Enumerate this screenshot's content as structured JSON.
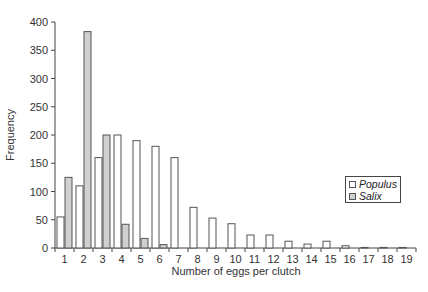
{
  "chart_data": {
    "type": "bar",
    "title": "",
    "xlabel": "Number of eggs per clutch",
    "ylabel": "Frequency",
    "ylim": [
      0,
      400
    ],
    "yticks": [
      0,
      50,
      100,
      150,
      200,
      250,
      300,
      350,
      400
    ],
    "grid": false,
    "legend_position": "right",
    "categories": [
      "1",
      "2",
      "3",
      "4",
      "5",
      "6",
      "7",
      "8",
      "9",
      "10",
      "11",
      "12",
      "13",
      "14",
      "15",
      "16",
      "17",
      "18",
      "19"
    ],
    "series": [
      {
        "name": "Populus",
        "color": "#ffffff",
        "values": [
          55,
          110,
          160,
          200,
          190,
          180,
          160,
          72,
          53,
          43,
          23,
          23,
          12,
          7,
          12,
          4,
          1,
          1,
          1
        ]
      },
      {
        "name": "Salix",
        "color": "#d0d0d0",
        "values": [
          125,
          383,
          200,
          42,
          17,
          6,
          0,
          0,
          0,
          0,
          0,
          0,
          0,
          0,
          0,
          0,
          0,
          0,
          0
        ]
      }
    ]
  },
  "legend": {
    "items": [
      {
        "label": "Populus",
        "color": "#ffffff"
      },
      {
        "label": "Salix",
        "color": "#d0d0d0"
      }
    ]
  }
}
